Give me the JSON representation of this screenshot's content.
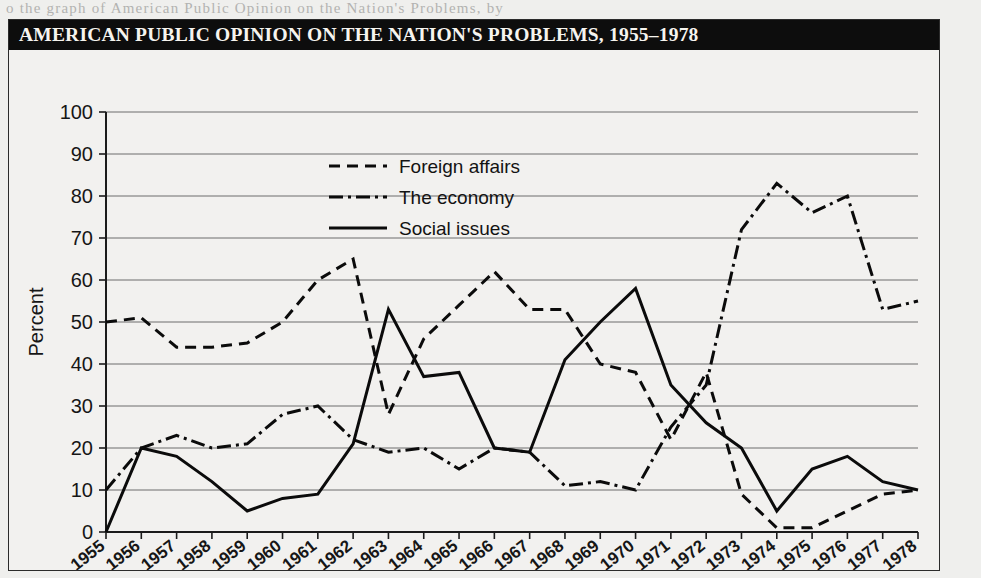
{
  "bleed_text": "o the  graph  of  American  Public  Opinion  on  the  Nation's  Problems,  by",
  "figure": {
    "title": "AMERICAN PUBLIC OPINION ON THE NATION'S PROBLEMS, 1955–1978"
  },
  "legend": {
    "items": [
      {
        "label": "Foreign affairs",
        "style": "dashed"
      },
      {
        "label": "The economy",
        "style": "dash-dot"
      },
      {
        "label": "Social issues",
        "style": "solid"
      }
    ]
  },
  "colors": {
    "ink": "#0b0b0b",
    "title_bar": "#0d0d0d",
    "title_text": "#f6f4ef",
    "paper": "#f2f1ef",
    "gridline": "#6d6d6d"
  },
  "chart_data": {
    "type": "line",
    "title": "AMERICAN PUBLIC OPINION ON THE NATION'S PROBLEMS, 1955–1978",
    "xlabel": "",
    "ylabel": "Percent",
    "ylim": [
      0,
      100
    ],
    "ytick_step": 10,
    "yticks": [
      0,
      10,
      20,
      30,
      40,
      50,
      60,
      70,
      80,
      90,
      100
    ],
    "grid": true,
    "legend_position": "upper-center",
    "categories": [
      "1955",
      "1956",
      "1957",
      "1958",
      "1959",
      "1960",
      "1961",
      "1962",
      "1963",
      "1964",
      "1965",
      "1966",
      "1967",
      "1968",
      "1969",
      "1970",
      "1971",
      "1972",
      "1973",
      "1974",
      "1975",
      "1976",
      "1977",
      "1978"
    ],
    "series": [
      {
        "name": "Foreign affairs",
        "style": "dashed",
        "values": [
          50,
          51,
          44,
          44,
          45,
          50,
          60,
          65,
          28,
          46,
          54,
          62,
          53,
          53,
          40,
          38,
          22,
          38,
          9,
          1,
          1,
          5,
          9,
          10
        ]
      },
      {
        "name": "The economy",
        "style": "dash-dot",
        "values": [
          10,
          20,
          23,
          20,
          21,
          28,
          30,
          22,
          19,
          20,
          15,
          20,
          19,
          11,
          12,
          10,
          25,
          35,
          72,
          83,
          76,
          80,
          53,
          55
        ]
      },
      {
        "name": "Social issues",
        "style": "solid",
        "values": [
          0,
          20,
          18,
          12,
          5,
          8,
          9,
          21,
          53,
          37,
          38,
          20,
          19,
          41,
          50,
          58,
          35,
          26,
          20,
          5,
          15,
          18,
          12,
          10
        ]
      }
    ]
  }
}
